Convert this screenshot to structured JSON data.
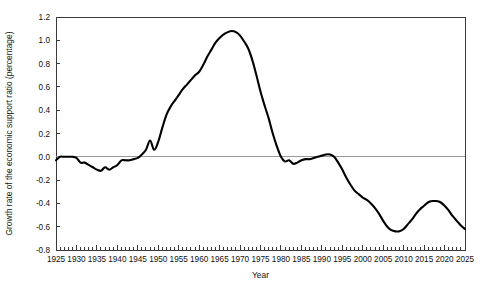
{
  "chart_data": {
    "type": "line",
    "title": "",
    "xlabel": "Year",
    "ylabel": "Growth rate of the economic support ratio (percentage)",
    "xlim": [
      1925,
      2025
    ],
    "ylim": [
      -0.8,
      1.2
    ],
    "xticks": [
      1925,
      1930,
      1935,
      1940,
      1945,
      1950,
      1955,
      1960,
      1965,
      1970,
      1975,
      1980,
      1985,
      1990,
      1995,
      2000,
      2005,
      2010,
      2015,
      2020,
      2025
    ],
    "yticks": [
      -0.8,
      -0.6,
      -0.4,
      -0.2,
      0.0,
      0.2,
      0.4,
      0.6,
      0.8,
      1.0,
      1.2
    ],
    "xtick_labels": [
      "1925",
      "1930",
      "1935",
      "1940",
      "1945",
      "1950",
      "1955",
      "1960",
      "1965",
      "1970",
      "1975",
      "1980",
      "1985",
      "1990",
      "1995",
      "2000",
      "2005",
      "2010",
      "2015",
      "2020",
      "2025"
    ],
    "ytick_labels": [
      "-0.8",
      "-0.6",
      "-0.4",
      "-0.2",
      "0.0",
      "0.2",
      "0.4",
      "0.6",
      "0.8",
      "1.0",
      "1.2"
    ],
    "minor_xtick_interval": 1,
    "grid": false,
    "legend": false,
    "zero_reference_line": 0.0,
    "line_color": "#000000",
    "zero_line_color": "#9a9a9a",
    "frame_color": "#3a3a3a",
    "series": [
      {
        "name": "Growth rate of the economic support ratio",
        "x": [
          1925,
          1926,
          1927,
          1928,
          1929,
          1930,
          1931,
          1932,
          1933,
          1934,
          1935,
          1936,
          1937,
          1938,
          1939,
          1940,
          1941,
          1942,
          1943,
          1944,
          1945,
          1946,
          1947,
          1948,
          1949,
          1950,
          1951,
          1952,
          1953,
          1954,
          1955,
          1956,
          1957,
          1958,
          1959,
          1960,
          1961,
          1962,
          1963,
          1964,
          1965,
          1966,
          1967,
          1968,
          1969,
          1970,
          1971,
          1972,
          1973,
          1974,
          1975,
          1976,
          1977,
          1978,
          1979,
          1980,
          1981,
          1982,
          1983,
          1984,
          1985,
          1986,
          1987,
          1988,
          1989,
          1990,
          1991,
          1992,
          1993,
          1994,
          1995,
          1996,
          1997,
          1998,
          1999,
          2000,
          2001,
          2002,
          2003,
          2004,
          2005,
          2006,
          2007,
          2008,
          2009,
          2010,
          2011,
          2012,
          2013,
          2014,
          2015,
          2016,
          2017,
          2018,
          2019,
          2020,
          2021,
          2022,
          2023,
          2024,
          2025
        ],
        "y": [
          -0.03,
          0.0,
          0.0,
          0.0,
          0.0,
          -0.01,
          -0.05,
          -0.05,
          -0.07,
          -0.09,
          -0.11,
          -0.12,
          -0.09,
          -0.11,
          -0.09,
          -0.07,
          -0.03,
          -0.03,
          -0.03,
          -0.02,
          -0.01,
          0.02,
          0.06,
          0.14,
          0.06,
          0.13,
          0.25,
          0.36,
          0.43,
          0.48,
          0.53,
          0.58,
          0.62,
          0.66,
          0.7,
          0.73,
          0.79,
          0.86,
          0.92,
          0.98,
          1.02,
          1.05,
          1.07,
          1.08,
          1.07,
          1.04,
          0.99,
          0.93,
          0.83,
          0.7,
          0.56,
          0.44,
          0.33,
          0.2,
          0.09,
          0.0,
          -0.04,
          -0.03,
          -0.06,
          -0.05,
          -0.03,
          -0.02,
          -0.02,
          -0.01,
          0.0,
          0.01,
          0.02,
          0.02,
          0.0,
          -0.05,
          -0.11,
          -0.18,
          -0.24,
          -0.29,
          -0.32,
          -0.35,
          -0.37,
          -0.4,
          -0.44,
          -0.49,
          -0.55,
          -0.6,
          -0.63,
          -0.64,
          -0.64,
          -0.62,
          -0.58,
          -0.54,
          -0.49,
          -0.45,
          -0.42,
          -0.39,
          -0.38,
          -0.38,
          -0.39,
          -0.42,
          -0.46,
          -0.51,
          -0.55,
          -0.59,
          -0.62
        ]
      }
    ]
  },
  "plot_geometry": {
    "left": 56,
    "right": 465,
    "top": 17,
    "bottom": 250
  }
}
